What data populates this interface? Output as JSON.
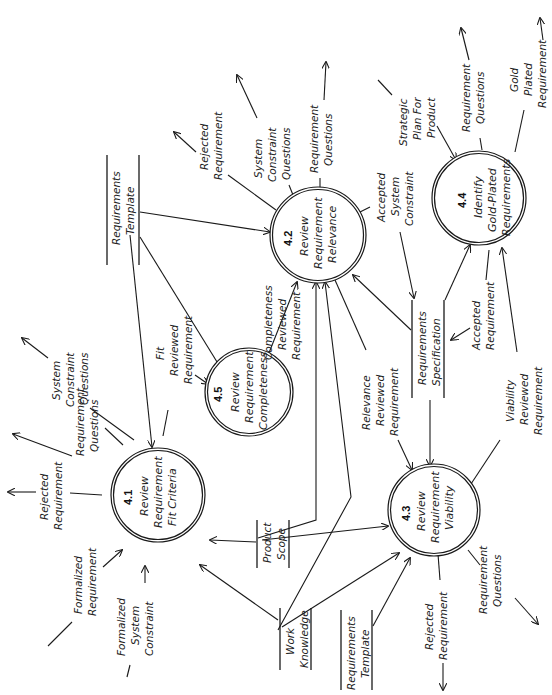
{
  "diagram": {
    "type": "data-flow-diagram",
    "orientation": "rotated-90-ccw",
    "processes": [
      {
        "id": "4.1",
        "lines": [
          "Review",
          "Requirement",
          "Fit Criteria"
        ]
      },
      {
        "id": "4.2",
        "lines": [
          "Review",
          "Requirement",
          "Relevance"
        ]
      },
      {
        "id": "4.3",
        "lines": [
          "Review",
          "Requirement",
          "Viability"
        ]
      },
      {
        "id": "4.4",
        "lines": [
          "Identify",
          "Gold-Plated",
          "Requirements"
        ]
      },
      {
        "id": "4.5",
        "lines": [
          "Review",
          "Requirement",
          "Completeness"
        ]
      }
    ],
    "stores": [
      {
        "key": "req_template_top",
        "lines": [
          "Requirements",
          "Template"
        ]
      },
      {
        "key": "product_scope",
        "lines": [
          "Product",
          "Scope"
        ]
      },
      {
        "key": "work_knowledge",
        "lines": [
          "Work",
          "Knowledge"
        ]
      },
      {
        "key": "req_template_bottom",
        "lines": [
          "Requirements",
          "Template"
        ]
      },
      {
        "key": "req_spec",
        "lines": [
          "Requirements",
          "Specification"
        ]
      }
    ],
    "flows": {
      "f41_rejected": [
        "Rejected",
        "Requirement"
      ],
      "f41_formalized_req": [
        "Formalized",
        "Requirement"
      ],
      "f41_formalized_sys": [
        "Formalized",
        "System",
        "Constraint"
      ],
      "f41_req_questions": [
        "Requirement",
        "Questions"
      ],
      "f41_sys_questions": [
        "System",
        "Constraint",
        "Questions"
      ],
      "f41_fit_reviewed": [
        "Fit",
        "Reviewed",
        "Requirement"
      ],
      "f42_rejected": [
        "Rejected",
        "Requirement"
      ],
      "f42_sys_questions": [
        "System",
        "Constraint",
        "Questions"
      ],
      "f42_req_questions": [
        "Requirement",
        "Questions"
      ],
      "f42_accepted_sys": [
        "Accepted",
        "System",
        "Constraint"
      ],
      "f45_completeness": [
        "Completeness",
        "Reviewed",
        "Requirement"
      ],
      "f42_relevance": [
        "Relevance",
        "Reviewed",
        "Requirement"
      ],
      "f43_rejected": [
        "Rejected",
        "Requirement"
      ],
      "f43_req_questions": [
        "Requirement",
        "Questions"
      ],
      "f43_viability": [
        "Viability",
        "Reviewed",
        "Requirement"
      ],
      "f44_strategic": [
        "Strategic",
        "Plan For",
        "Product"
      ],
      "f44_req_questions": [
        "Requirement",
        "Questions"
      ],
      "f44_gold_plated": [
        "Gold",
        "Plated",
        "Requirement"
      ],
      "f44_accepted": [
        "Accepted",
        "Requirement"
      ]
    }
  }
}
